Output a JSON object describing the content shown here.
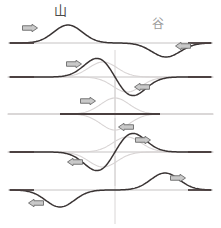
{
  "figure": {
    "title_labels": {
      "crest": "山",
      "trough": "谷"
    },
    "colors": {
      "resultant_wave": "#3a3434",
      "ghost_wave": "#d8d4d4",
      "baseline": "#b8b4b4",
      "baseline_dark": "#4a3f3f",
      "center_line": "#cfcccc",
      "arrow_outline": "#6a6a6a",
      "arrow_fill": "#c9c9c9",
      "label_crest": "#4a4a4a",
      "label_trough": "#9b9b9b",
      "background": "#ffffff"
    },
    "geometry": {
      "width": 221,
      "height": 228,
      "center_x": 115,
      "baselines": [
        43,
        77,
        114,
        152,
        190
      ],
      "amplitude": 18,
      "pulse_width": 30
    },
    "rows": [
      {
        "name": "row-1-approaching",
        "baseline": 43,
        "center_line": false,
        "flat_segment": null,
        "arrows": [
          {
            "name": "arrow-right-crest",
            "dir": "right",
            "x": 30,
            "y": 28
          },
          {
            "name": "arrow-left-trough",
            "dir": "left",
            "x": 183,
            "y": 46
          }
        ],
        "ghosts": [],
        "resultant": [
          {
            "center": 68,
            "amp": 18
          },
          {
            "center": 166,
            "amp": -14
          }
        ]
      },
      {
        "name": "row-2-overlapping-partial",
        "baseline": 77,
        "center_line": true,
        "flat_segment": null,
        "arrows": [
          {
            "name": "arrow-right-crest",
            "dir": "right",
            "x": 74,
            "y": 64
          },
          {
            "name": "arrow-left-trough",
            "dir": "left",
            "x": 142,
            "y": 87
          }
        ],
        "ghosts": [
          {
            "center": 103,
            "amp": 15
          },
          {
            "center": 127,
            "amp": -15
          }
        ],
        "resultant": [
          {
            "center": 99,
            "amp": 20
          },
          {
            "center": 131,
            "amp": -20
          }
        ]
      },
      {
        "name": "row-3-cancellation",
        "baseline": 114,
        "center_line": true,
        "flat_segment": {
          "x1": 60,
          "x2": 160
        },
        "arrows": [
          {
            "name": "arrow-right-crest",
            "dir": "right",
            "x": 88,
            "y": 101
          },
          {
            "name": "arrow-left-trough",
            "dir": "left",
            "x": 126,
            "y": 127
          }
        ],
        "ghosts": [
          {
            "center": 115,
            "amp": 16
          },
          {
            "center": 115,
            "amp": -16
          }
        ],
        "resultant": []
      },
      {
        "name": "row-4-separating-partial",
        "baseline": 152,
        "center_line": true,
        "flat_segment": null,
        "arrows": [
          {
            "name": "arrow-right-crest",
            "dir": "right",
            "x": 143,
            "y": 140
          },
          {
            "name": "arrow-left-trough",
            "dir": "left",
            "x": 75,
            "y": 162
          }
        ],
        "ghosts": [
          {
            "center": 127,
            "amp": 15
          },
          {
            "center": 103,
            "amp": -15
          }
        ],
        "resultant": [
          {
            "center": 131,
            "amp": 20
          },
          {
            "center": 99,
            "amp": -20
          }
        ]
      },
      {
        "name": "row-5-separated",
        "baseline": 190,
        "center_line": true,
        "flat_segment": null,
        "arrows": [
          {
            "name": "arrow-left-trough",
            "dir": "left",
            "x": 36,
            "y": 203
          },
          {
            "name": "arrow-right-crest",
            "dir": "right",
            "x": 178,
            "y": 178
          }
        ],
        "ghosts": [],
        "resultant": [
          {
            "center": 60,
            "amp": -17
          },
          {
            "center": 165,
            "amp": 17
          }
        ]
      }
    ]
  }
}
